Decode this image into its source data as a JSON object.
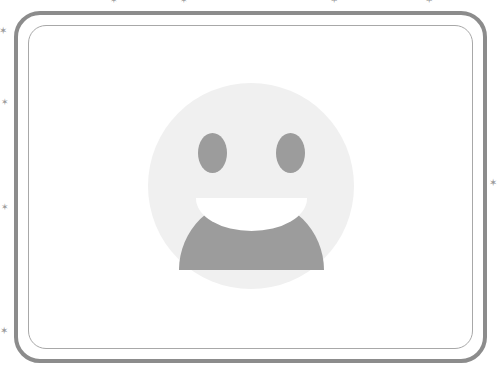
{
  "card": {
    "name": "emoji-card",
    "border_color": "#8c8c8c",
    "inner_border_color": "#a8a8a8",
    "background_color": "#ffffff"
  },
  "emoji": {
    "name": "grinning-face-with-smiling-eyes",
    "glyph": "😀",
    "face_color": "#f0f0f0",
    "feature_color": "#9c9c9c",
    "teeth_color": "#ffffff",
    "alt_text": "Grinning face emoji"
  },
  "sparkles": {
    "glyph": "✶",
    "color": "#9a9a9a",
    "items": [
      {
        "id": "sparkle-top-1",
        "x": 110,
        "y": -4,
        "size": 9
      },
      {
        "id": "sparkle-top-2",
        "x": 180,
        "y": -4,
        "size": 9
      },
      {
        "id": "sparkle-top-3",
        "x": 330,
        "y": -5,
        "size": 10
      },
      {
        "id": "sparkle-top-4",
        "x": 425,
        "y": -5,
        "size": 10
      },
      {
        "id": "sparkle-left-1",
        "x": -1,
        "y": 26,
        "size": 10
      },
      {
        "id": "sparkle-left-2",
        "x": 1,
        "y": 98,
        "size": 9
      },
      {
        "id": "sparkle-left-3",
        "x": 1,
        "y": 203,
        "size": 9
      },
      {
        "id": "sparkle-left-4",
        "x": 0,
        "y": 326,
        "size": 10
      },
      {
        "id": "sparkle-right-1",
        "x": 489,
        "y": 178,
        "size": 10
      }
    ]
  }
}
